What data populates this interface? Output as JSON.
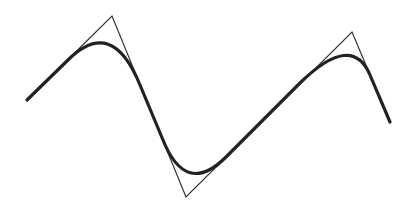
{
  "diagram": {
    "type": "spline-with-control-polygon",
    "background": "#ffffff",
    "control_polygon": {
      "color": "#333333",
      "stroke_width": 1.2,
      "points": [
        [
          27,
          100
        ],
        [
          112,
          16
        ],
        [
          186,
          197
        ],
        [
          352,
          32
        ],
        [
          390,
          122
        ]
      ]
    },
    "curve": {
      "color": "#222222",
      "stroke_width": 3.2,
      "path": "M27,100 L68,60 Q112,16 140,85 L163,140 Q186,197 226,157 L300,83 Q352,32 370,75 L390,122"
    }
  }
}
